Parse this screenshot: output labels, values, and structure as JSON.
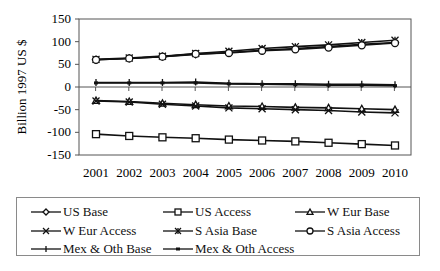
{
  "chart_data": {
    "type": "line",
    "title": "",
    "xlabel": "",
    "ylabel": "Billion 1997 US $",
    "ylim": [
      -150,
      150
    ],
    "yticks": [
      150,
      100,
      50,
      0,
      -50,
      -100,
      -150
    ],
    "grid": false,
    "legend_position": "bottom",
    "x": [
      "2001",
      "2002",
      "2003",
      "2004",
      "2005",
      "2006",
      "2007",
      "2008",
      "2009",
      "2010"
    ],
    "series": [
      {
        "name": "US Base",
        "marker": "diamond",
        "values": [
          60,
          63,
          67,
          72,
          76,
          81,
          85,
          89,
          94,
          98
        ]
      },
      {
        "name": "US Access",
        "marker": "square",
        "values": [
          -104,
          -108,
          -111,
          -113,
          -116,
          -118,
          -120,
          -123,
          -126,
          -129
        ]
      },
      {
        "name": "W Eur Base",
        "marker": "triangle",
        "values": [
          -30,
          -32,
          -36,
          -39,
          -42,
          -43,
          -45,
          -46,
          -48,
          -50
        ]
      },
      {
        "name": "W Eur Access",
        "marker": "x",
        "values": [
          -31,
          -33,
          -38,
          -42,
          -46,
          -48,
          -50,
          -52,
          -55,
          -57
        ]
      },
      {
        "name": "S Asia Base",
        "marker": "star",
        "values": [
          61,
          64,
          68,
          74,
          79,
          85,
          89,
          93,
          98,
          103
        ]
      },
      {
        "name": "S Asia Access",
        "marker": "circle",
        "values": [
          60,
          63,
          67,
          73,
          75,
          80,
          83,
          87,
          92,
          97
        ]
      },
      {
        "name": "Mex & Oth Base",
        "marker": "plus",
        "values": [
          10,
          10,
          10,
          11,
          8,
          7,
          7,
          6,
          6,
          5
        ]
      },
      {
        "name": "Mex & Oth Access",
        "marker": "dash",
        "values": [
          9,
          9,
          9,
          9,
          7,
          6,
          5,
          4,
          4,
          3
        ]
      }
    ],
    "annotations": [
      "Series-to-line assignment is a best estimate; markers were not fully resolvable at this resolution."
    ]
  },
  "legend": {
    "items": [
      {
        "label": "US Base",
        "marker": "diamond"
      },
      {
        "label": "US Access",
        "marker": "square"
      },
      {
        "label": "W Eur Base",
        "marker": "triangle"
      },
      {
        "label": "W Eur Access",
        "marker": "x"
      },
      {
        "label": "S Asia Base",
        "marker": "star"
      },
      {
        "label": "S Asia Access",
        "marker": "circle"
      },
      {
        "label": "Mex & Oth Base",
        "marker": "plus"
      },
      {
        "label": "Mex & Oth Access",
        "marker": "dash"
      }
    ]
  },
  "style": {
    "line_color": "#111111",
    "frame_color": "#555555"
  }
}
